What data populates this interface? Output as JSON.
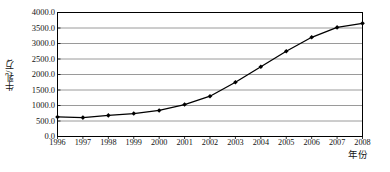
{
  "chart_data": {
    "type": "line",
    "title": "",
    "xlabel": "年份",
    "ylabel": "牛乳/万t",
    "categories": [
      "1996",
      "1997",
      "1998",
      "1999",
      "2000",
      "2001",
      "2002",
      "2003",
      "2004",
      "2005",
      "2006",
      "2007",
      "2008"
    ],
    "x": [
      1996,
      1997,
      1998,
      1999,
      2000,
      2001,
      2002,
      2003,
      2004,
      2005,
      2006,
      2007,
      2008
    ],
    "values": [
      630,
      610,
      680,
      740,
      840,
      1030,
      1300,
      1750,
      2250,
      2750,
      3200,
      3520,
      3650
    ],
    "series": [
      {
        "name": "牛乳",
        "values": [
          630,
          610,
          680,
          740,
          840,
          1030,
          1300,
          1750,
          2250,
          2750,
          3200,
          3520,
          3650
        ]
      }
    ],
    "ylim": [
      0,
      4000
    ],
    "ytick_labels": [
      "0.0",
      "500.0",
      "1000.0",
      "1500.0",
      "2000.0",
      "2500.0",
      "3000.0",
      "3500.0",
      "4000.0"
    ],
    "ytick_values": [
      0,
      500,
      1000,
      1500,
      2000,
      2500,
      3000,
      3500,
      4000
    ],
    "grid": "horizontal",
    "legend": "none",
    "line_color": "#000000",
    "marker": "diamond",
    "marker_color": "#000000",
    "grid_color": "#808080",
    "frame_color": "#000000",
    "background": "#ffffff"
  }
}
